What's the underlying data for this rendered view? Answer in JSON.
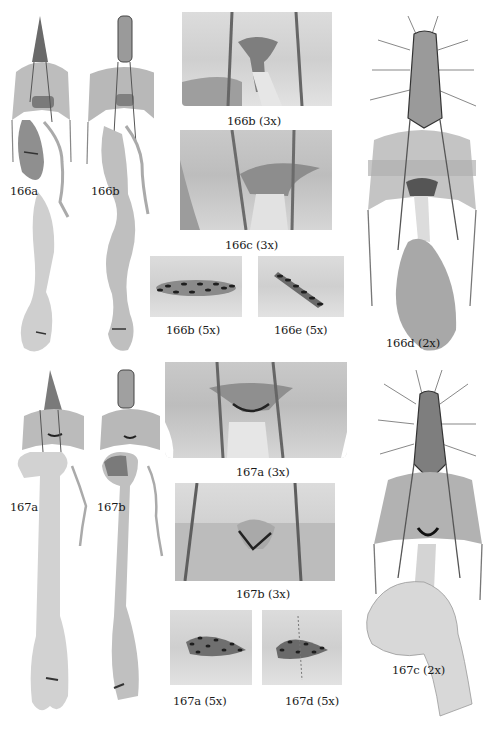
{
  "figure": {
    "background": "#ffffff",
    "ink_color": "#1a1a1a",
    "panels": [
      {
        "id": "166a",
        "label": "166a",
        "kind": "whole-mount"
      },
      {
        "id": "166b",
        "label": "166b",
        "kind": "whole-mount"
      },
      {
        "id": "166b-3x",
        "label": "166b (3x)",
        "kind": "detail"
      },
      {
        "id": "166c-3x",
        "label": "166c (3x)",
        "kind": "detail"
      },
      {
        "id": "166b-5x",
        "label": "166b (5x)",
        "kind": "signum-detail"
      },
      {
        "id": "166e-5x",
        "label": "166e (5x)",
        "kind": "signum-detail"
      },
      {
        "id": "166d-2x",
        "label": "166d (2x)",
        "kind": "whole-mount"
      },
      {
        "id": "167a",
        "label": "167a",
        "kind": "whole-mount"
      },
      {
        "id": "167b",
        "label": "167b",
        "kind": "whole-mount"
      },
      {
        "id": "167a-3x",
        "label": "167a (3x)",
        "kind": "detail"
      },
      {
        "id": "167b-3x",
        "label": "167b (3x)",
        "kind": "detail"
      },
      {
        "id": "167a-5x",
        "label": "167a (5x)",
        "kind": "signum-detail"
      },
      {
        "id": "167d-5x",
        "label": "167d (5x)",
        "kind": "signum-detail"
      },
      {
        "id": "167c-2x",
        "label": "167c (2x)",
        "kind": "whole-mount"
      }
    ]
  }
}
